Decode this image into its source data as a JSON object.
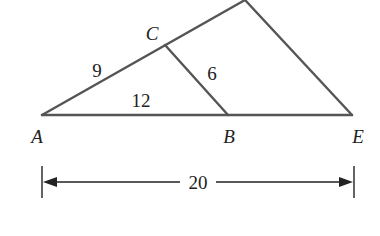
{
  "diagram": {
    "points": {
      "A": {
        "label": "A",
        "x": 42,
        "y": 115
      },
      "B": {
        "label": "B",
        "x": 228,
        "y": 115
      },
      "C": {
        "label": "C",
        "x": 165,
        "y": 45
      },
      "E": {
        "label": "E",
        "x": 352,
        "y": 115
      },
      "D": {
        "label": "",
        "x": 245,
        "y": 0
      }
    },
    "segment_labels": {
      "AC": "9",
      "AB": "12",
      "CB": "6"
    },
    "dimension": {
      "from": "A",
      "to": "E",
      "value": "20"
    },
    "colors": {
      "figure_line": "#555555",
      "dimension_line": "#222222",
      "text": "#222222",
      "background": "#ffffff"
    }
  }
}
